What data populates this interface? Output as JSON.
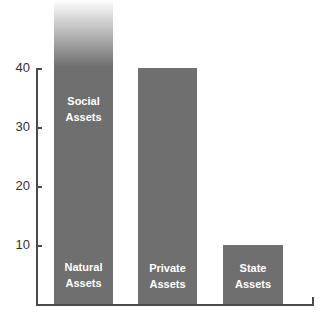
{
  "chart_data": {
    "type": "bar",
    "title": "",
    "xlabel": "",
    "ylabel": "",
    "ylim": [
      0,
      40
    ],
    "yticks": [
      10,
      20,
      30,
      40
    ],
    "grid": false,
    "legend": null,
    "categories": [
      "Natural Assets / Social Assets",
      "Private Assets",
      "State Assets"
    ],
    "values": [
      52,
      40,
      10
    ],
    "bars": [
      {
        "labels": [
          "Natural Assets",
          "Social Assets"
        ],
        "value": 52,
        "note": "bar extends beyond top of axis, fading out"
      },
      {
        "labels": [
          "Private Assets"
        ],
        "value": 40
      },
      {
        "labels": [
          "State Assets"
        ],
        "value": 10
      }
    ],
    "annotations": [
      "Social Assets (upper label in first bar)",
      "Natural Assets (lower label in first bar)"
    ]
  },
  "axis": {
    "ticks": [
      {
        "label": "40",
        "value": 40
      },
      {
        "label": "30",
        "value": 30
      },
      {
        "label": "20",
        "value": 20
      },
      {
        "label": "10",
        "value": 10
      }
    ]
  },
  "labels": {
    "bar1_top_line1": "Social",
    "bar1_top_line2": "Assets",
    "bar1_bottom_line1": "Natural",
    "bar1_bottom_line2": "Assets",
    "bar2_line1": "Private",
    "bar2_line2": "Assets",
    "bar3_line1": "State",
    "bar3_line2": "Assets"
  },
  "colors": {
    "bar": "#6f6f6f",
    "axis": "#4a4a4a",
    "label_text": "#ffffff",
    "tick_text": "#333333"
  }
}
